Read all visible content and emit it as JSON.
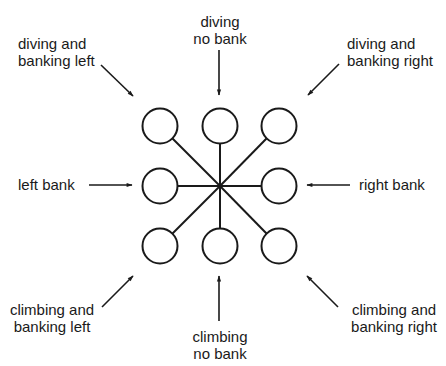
{
  "diagram": {
    "type": "attitude-indicator-pattern",
    "center": {
      "x": 220,
      "y": 186
    },
    "circles": [
      {
        "id": "top-left",
        "x": 160,
        "y": 126
      },
      {
        "id": "top-center",
        "x": 220,
        "y": 126
      },
      {
        "id": "top-right",
        "x": 279,
        "y": 126
      },
      {
        "id": "middle-left",
        "x": 160,
        "y": 186
      },
      {
        "id": "middle-right",
        "x": 279,
        "y": 186
      },
      {
        "id": "bottom-left",
        "x": 160,
        "y": 246
      },
      {
        "id": "bottom-center",
        "x": 220,
        "y": 246
      },
      {
        "id": "bottom-right",
        "x": 279,
        "y": 246
      }
    ],
    "labels": {
      "diving_banking_left": {
        "line1": "diving and",
        "line2": "banking left"
      },
      "diving_no_bank": {
        "line1": "diving",
        "line2": "no bank"
      },
      "diving_banking_right": {
        "line1": "diving and",
        "line2": "banking right"
      },
      "left_bank": {
        "line1": "left bank"
      },
      "right_bank": {
        "line1": "right bank"
      },
      "climbing_banking_left": {
        "line1": "climbing and",
        "line2": "banking left"
      },
      "climbing_no_bank": {
        "line1": "climbing",
        "line2": "no bank"
      },
      "climbing_banking_right": {
        "line1": "climbing and",
        "line2": "banking right"
      }
    },
    "colors": {
      "stroke": "#1a1a1a",
      "background": "#ffffff"
    }
  }
}
